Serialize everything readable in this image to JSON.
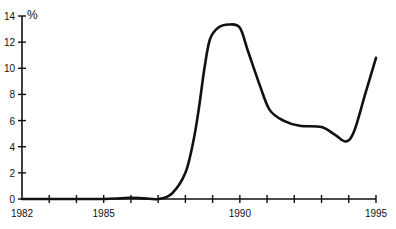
{
  "chart_data": {
    "type": "line",
    "title": "",
    "xlabel": "",
    "ylabel": "%",
    "xlim": [
      1982,
      1995
    ],
    "ylim": [
      0,
      14
    ],
    "x_tick_labels": [
      "1982",
      "1985",
      "1990",
      "1995"
    ],
    "x_ticks_every_year": true,
    "y_tick_labels": [
      "0",
      "2",
      "4",
      "6",
      "8",
      "10",
      "12",
      "14"
    ],
    "grid": false,
    "legend": null,
    "series": [
      {
        "name": "Rate",
        "color": "#111111",
        "points": [
          [
            1982.0,
            0.0
          ],
          [
            1983.0,
            0.0
          ],
          [
            1984.0,
            0.0
          ],
          [
            1985.0,
            0.0
          ],
          [
            1985.6,
            0.05
          ],
          [
            1986.0,
            0.1
          ],
          [
            1986.5,
            0.05
          ],
          [
            1987.0,
            0.0
          ],
          [
            1987.5,
            0.4
          ],
          [
            1988.0,
            2.0
          ],
          [
            1988.3,
            4.5
          ],
          [
            1988.5,
            7.0
          ],
          [
            1988.7,
            10.0
          ],
          [
            1988.9,
            12.2
          ],
          [
            1989.2,
            13.1
          ],
          [
            1989.6,
            13.35
          ],
          [
            1990.0,
            13.1
          ],
          [
            1990.3,
            11.3
          ],
          [
            1990.75,
            8.6
          ],
          [
            1991.1,
            6.8
          ],
          [
            1991.6,
            6.0
          ],
          [
            1992.2,
            5.6
          ],
          [
            1993.0,
            5.5
          ],
          [
            1993.5,
            4.9
          ],
          [
            1993.9,
            4.4
          ],
          [
            1994.2,
            5.2
          ],
          [
            1994.6,
            8.0
          ],
          [
            1995.0,
            10.8
          ]
        ]
      }
    ]
  }
}
